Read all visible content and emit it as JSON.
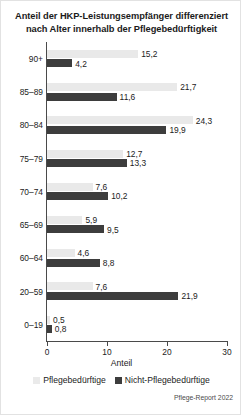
{
  "chart_data": {
    "type": "bar",
    "orientation": "horizontal",
    "title": "Anteil der HKP-Leistungsempfänger differenziert nach Alter innerhalb der Pflegebedürftigkeit",
    "title_lines": [
      "Anteil der HKP-Leistungsempfänger differenziert",
      "nach Alter innerhalb der Pflegebedürftigkeit"
    ],
    "xlabel": "Anteil",
    "ylabel": "",
    "xlim": [
      0,
      30
    ],
    "xticks": [
      0,
      10,
      20,
      30
    ],
    "xticklabels": [
      "0",
      "10",
      "20",
      "30"
    ],
    "grid": false,
    "legend_position": "bottom",
    "categories": [
      "90+",
      "85–89",
      "80–84",
      "75–79",
      "70–74",
      "65–69",
      "60–64",
      "20–59",
      "0–19"
    ],
    "series": [
      {
        "name": "Pflegebedürftige",
        "color": "#e9e9e9",
        "values": [
          15.2,
          21.7,
          24.3,
          12.7,
          7.6,
          5.9,
          4.6,
          7.6,
          0.5
        ],
        "labels": [
          "15,2",
          "21,7",
          "24,3",
          "12,7",
          "7,6",
          "5,9",
          "4,6",
          "7,6",
          "0,5"
        ]
      },
      {
        "name": "Nicht-Pflegebedürftige",
        "color": "#3d3d3d",
        "values": [
          4.2,
          11.6,
          19.9,
          13.3,
          10.2,
          9.5,
          8.8,
          21.9,
          0.8
        ],
        "labels": [
          "4,2",
          "11,6",
          "19,9",
          "13,3",
          "10,2",
          "9,5",
          "8,8",
          "21,9",
          "0,8"
        ]
      }
    ],
    "source": "Pflege-Report 2022"
  }
}
